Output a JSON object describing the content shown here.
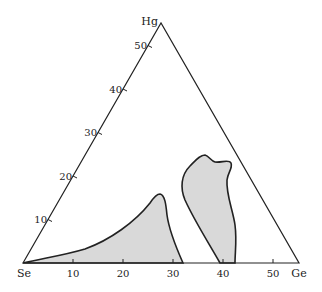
{
  "diagram": {
    "type": "ternary-phase-diagram",
    "vertices": {
      "top": "Hg",
      "left": "Se",
      "right": "Ge"
    },
    "bottom_axis_ticks": [
      "10",
      "20",
      "30",
      "40",
      "50"
    ],
    "left_axis_ticks": [
      "10",
      "20",
      "30",
      "40",
      "50"
    ],
    "regions": [
      {
        "name": "glass-forming-region-1",
        "fill": "#d9d9d9"
      },
      {
        "name": "glass-forming-region-2",
        "fill": "#d9d9d9"
      }
    ],
    "colors": {
      "line": "#222222",
      "fill": "#d9d9d9",
      "background": "#ffffff"
    }
  }
}
